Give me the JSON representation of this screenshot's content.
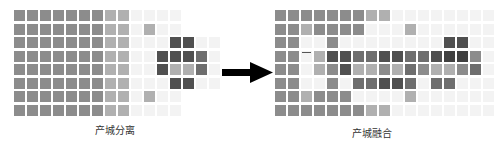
{
  "panels": [
    {
      "name": "separation",
      "label": "产城分离",
      "rows": [
        "2222222110000",
        "2222222110100",
        "2222222110004400",
        "2222222110044430",
        "2222222110041130",
        "2222222110004400",
        "2222222110100",
        "2222222110000"
      ]
    },
    {
      "name": "integration",
      "label": "产城融合",
      "rows": [
        "22222221100000000",
        "22122220001000000",
        "22002000000004400",
        "22014433443345520",
        "22012411213211230",
        "22002033443033000",
        "22122200001000000",
        "22222221100000000"
      ]
    }
  ],
  "arrow": {
    "direction": "right",
    "color": "#000000"
  },
  "legend_levels": {
    "0": "#f3f3f3",
    "1": "#b0b0b0",
    "2": "#8c8c8c",
    "3": "#6e6e6e",
    "4": "#505050",
    "5": "#404040"
  }
}
